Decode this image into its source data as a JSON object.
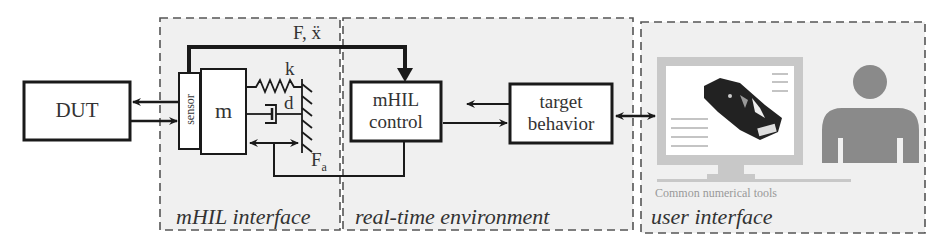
{
  "regions": {
    "mhil_interface": {
      "label": "mHIL interface"
    },
    "real_time_environment": {
      "label": "real-time environment"
    },
    "user_interface": {
      "label": "user interface"
    }
  },
  "blocks": {
    "dut": {
      "label": "DUT"
    },
    "sensor": {
      "label": "sensor"
    },
    "mass": {
      "label": "m"
    },
    "mhil_control": {
      "line1": "mHIL",
      "line2": "control"
    },
    "target_behavior": {
      "line1": "target",
      "line2": "behavior"
    }
  },
  "symbols": {
    "spring": "k",
    "damper": "d",
    "actuator_force": "F",
    "actuator_force_sub": "a",
    "feedback": "F, ẍ"
  },
  "user_interface": {
    "caption": "Common numerical tools",
    "icons": [
      "monitor-icon",
      "car-model-icon",
      "person-icon"
    ]
  },
  "colors": {
    "line": "#1a1a1a",
    "dashed_border": "#555555",
    "region_fill": "#f0f0f0",
    "icon_gray": "#8a8a8a",
    "monitor_frame": "#c8c8c8"
  }
}
